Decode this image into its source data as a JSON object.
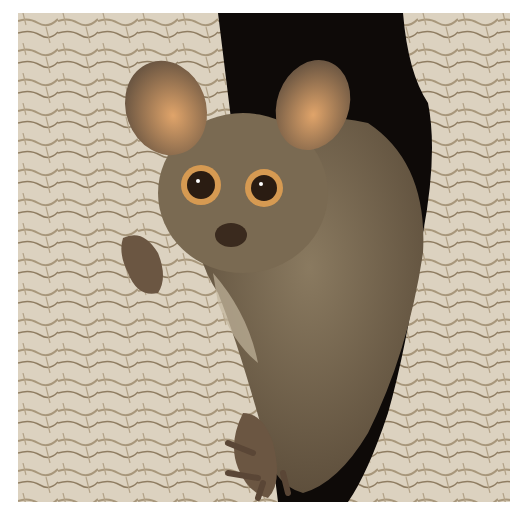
{
  "image": {
    "subject": "bushbaby in tree hollow",
    "colors": {
      "background": "#ffffff",
      "bark_light": "#e3dacb",
      "bark_mid": "#c9bba3",
      "bark_dark": "#8f7d62",
      "hollow": "#0e0a08",
      "fur": "#7a6a52",
      "fur_dark": "#5e4f3c",
      "fur_light": "#c2b59c",
      "ear_inner": "#d49a62",
      "eye_ring": "#d69a52",
      "eye": "#2a1c12"
    }
  }
}
